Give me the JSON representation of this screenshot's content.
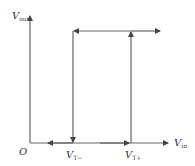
{
  "diagram": {
    "type": "hysteresis-transfer-characteristic",
    "y_axis": {
      "label": "V",
      "subscript": "out"
    },
    "x_axis": {
      "label": "V",
      "subscript": "in"
    },
    "origin_label": "O",
    "thresholds": [
      {
        "label": "V",
        "subscript": "T−"
      },
      {
        "label": "V",
        "subscript": "T+"
      }
    ],
    "colors": {
      "line": "#555555",
      "text": "#333333",
      "background": "#ffffff"
    }
  }
}
